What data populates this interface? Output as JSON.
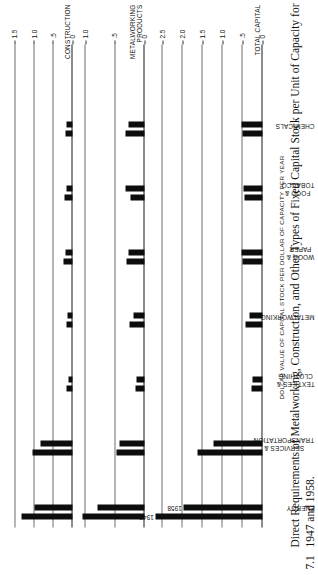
{
  "figure": {
    "number": "7.1",
    "caption": "Direct Requirements of Metalworking, Construction, and Other Types of Fixed Capital Stock per Unit of Capacity for 1947 and 1958.",
    "axis_label": "DOLLAR VALUE OF CAPITAL STOCK PER DOLLAR OF CAPACITY PER YEAR",
    "series_labels": {
      "first": "1947",
      "second": "1958"
    }
  },
  "chart_data": [
    {
      "type": "bar",
      "title": "TOTAL CAPITAL",
      "categories": [
        "ENERGY",
        "SERVICES &\nTRANSPORTATION",
        "TEXTILES &\nCLOTHING",
        "METALWORKING",
        "WOOD &\nPAPER",
        "FOOD &\nTOBACCO",
        "CHEMICALS"
      ],
      "series": [
        {
          "name": "1947",
          "values": [
            2.68,
            1.62,
            0.28,
            0.43,
            0.51,
            0.44,
            0.5
          ]
        },
        {
          "name": "1958",
          "values": [
            1.97,
            1.23,
            0.26,
            0.32,
            0.52,
            0.47,
            0.52
          ]
        }
      ],
      "ylabel": "DOLLAR VALUE OF CAPITAL STOCK PER DOLLAR OF CAPACITY PER YEAR",
      "ylim": [
        0,
        2.8
      ],
      "yticks": [
        0,
        0.5,
        1.0,
        1.5,
        2.0,
        2.5
      ],
      "yticklabels": [
        "0",
        ".5",
        "1.0",
        "1.5",
        "2.0",
        "2.5"
      ],
      "grid": true
    },
    {
      "type": "bar",
      "title": "METALWORKING\nPRODUCTS",
      "categories": [
        "ENERGY",
        "SERVICES &\nTRANSPORTATION",
        "TEXTILES &\nCLOTHING",
        "METALWORKING",
        "WOOD &\nPAPER",
        "FOOD &\nTOBACCO",
        "CHEMICALS"
      ],
      "series": [
        {
          "name": "1947",
          "values": [
            1.05,
            0.48,
            0.15,
            0.25,
            0.3,
            0.24,
            0.33
          ]
        },
        {
          "name": "1958",
          "values": [
            0.8,
            0.43,
            0.14,
            0.19,
            0.28,
            0.32,
            0.28
          ]
        }
      ],
      "ylim": [
        0,
        1.12
      ],
      "yticks": [
        0,
        0.5,
        1.0
      ],
      "yticklabels": [
        "0",
        ".5",
        "1.0"
      ],
      "grid": true
    },
    {
      "type": "bar",
      "title": "CONSTRUCTION",
      "categories": [
        "ENERGY",
        "SERVICES &\nTRANSPORTATION",
        "TEXTILES &\nCLOTHING",
        "METALWORKING",
        "WOOD &\nPAPER",
        "FOOD &\nTOBACCO",
        "CHEMICALS"
      ],
      "series": [
        {
          "name": "1947",
          "values": [
            1.33,
            1.05,
            0.17,
            0.17,
            0.24,
            0.21,
            0.19
          ]
        },
        {
          "name": "1958",
          "values": [
            0.99,
            0.83,
            0.11,
            0.12,
            0.19,
            0.17,
            0.17
          ]
        }
      ],
      "ylim": [
        0,
        1.62
      ],
      "yticks": [
        0,
        0.5,
        1.0,
        1.5
      ],
      "yticklabels": [
        "0",
        ".5",
        "1.0",
        "1.5"
      ],
      "grid": true
    },
    {
      "type": "bar",
      "title": "OTHER",
      "categories": [
        "ENERGY",
        "SERVICES &\nTRANSPORTATION",
        "TEXTILES &\nCLOTHING",
        "METALWORKING",
        "WOOD &\nPAPER",
        "FOOD &\nTOBACCO",
        "CHEMICALS"
      ],
      "series": [
        {
          "name": "1947",
          "values": [
            0.12,
            0.08,
            0.01,
            0.02,
            0.11,
            0.01,
            0.12
          ]
        },
        {
          "name": "1958",
          "values": [
            0.11,
            0.07,
            0.03,
            0.04,
            0.02,
            0.04,
            0.02
          ]
        }
      ],
      "ylim": [
        0,
        0.58
      ],
      "yticks": [
        0,
        0.5
      ],
      "yticklabels": [
        "0",
        ".5"
      ],
      "grid": true
    }
  ]
}
